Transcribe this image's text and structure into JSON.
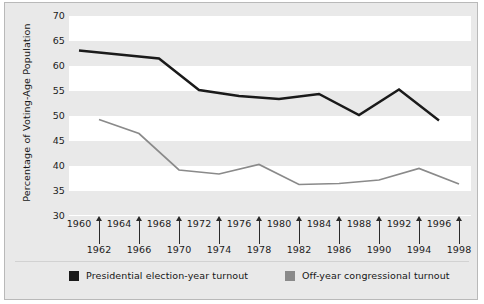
{
  "chart_data": {
    "type": "line",
    "title": "",
    "xlabel": "",
    "ylabel": "Percentage of Voting-Age Population",
    "ylim": [
      30,
      70
    ],
    "yticks": [
      30,
      35,
      40,
      45,
      50,
      55,
      60,
      65,
      70
    ],
    "grid": "alternating horizontal bands",
    "legend_position": "bottom",
    "x_presidential_years": [
      1960,
      1964,
      1968,
      1972,
      1976,
      1980,
      1984,
      1988,
      1992,
      1996
    ],
    "x_offyears": [
      1962,
      1966,
      1970,
      1974,
      1978,
      1982,
      1986,
      1990,
      1994,
      1998
    ],
    "series": [
      {
        "name": "Presidential election-year turnout",
        "color": "#1a1a1a",
        "x": [
          1960,
          1964,
          1968,
          1972,
          1976,
          1980,
          1984,
          1988,
          1992,
          1996
        ],
        "values": [
          63.1,
          62.3,
          61.5,
          55.2,
          54.0,
          53.4,
          54.4,
          50.2,
          55.3,
          49.1
        ]
      },
      {
        "name": "Off-year congressional turnout",
        "color": "#8a8a8a",
        "x": [
          1962,
          1966,
          1970,
          1974,
          1978,
          1982,
          1986,
          1990,
          1994,
          1998
        ],
        "values": [
          49.3,
          46.5,
          39.2,
          38.4,
          40.3,
          36.3,
          36.5,
          37.2,
          39.5,
          36.4
        ]
      }
    ]
  },
  "axis": {
    "ytick_labels": [
      "70",
      "65",
      "60",
      "55",
      "50",
      "45",
      "40",
      "35",
      "30"
    ],
    "ylabel": "Percentage of Voting-Age Population",
    "xtop_labels": [
      "1960",
      "1964",
      "1968",
      "1972",
      "1976",
      "1980",
      "1984",
      "1988",
      "1992",
      "1996"
    ],
    "xbot_labels": [
      "1962",
      "1966",
      "1970",
      "1974",
      "1978",
      "1982",
      "1986",
      "1990",
      "1994",
      "1998"
    ]
  },
  "legend": {
    "items": [
      {
        "label": "Presidential election-year turnout",
        "color": "#1a1a1a"
      },
      {
        "label": "Off-year congressional turnout",
        "color": "#8a8a8a"
      }
    ]
  }
}
